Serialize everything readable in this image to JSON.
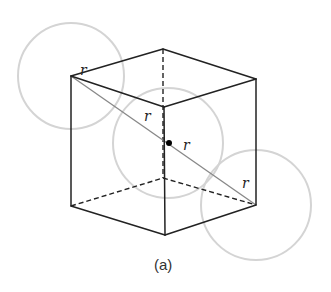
{
  "figure": {
    "caption": "(a)",
    "colors": {
      "edge": "#222222",
      "diagonal": "#888888",
      "circle": "#d4d4d4",
      "dot": "#000000"
    },
    "cube": {
      "vertices": {
        "top_left": [
          71,
          76
        ],
        "top_back": [
          163,
          49
        ],
        "top_right": [
          256,
          79
        ],
        "top_front": [
          164,
          107
        ],
        "bottom_left": [
          71,
          206
        ],
        "bottom_back": [
          163,
          178
        ],
        "bottom_right": [
          256,
          205
        ],
        "bottom_front": [
          165,
          235
        ]
      },
      "visible_edges": [
        [
          "top_left",
          "top_back"
        ],
        [
          "top_back",
          "top_right"
        ],
        [
          "top_right",
          "top_front"
        ],
        [
          "top_front",
          "top_left"
        ],
        [
          "top_left",
          "bottom_left"
        ],
        [
          "top_front",
          "bottom_front"
        ],
        [
          "top_right",
          "bottom_right"
        ],
        [
          "bottom_left",
          "bottom_front"
        ],
        [
          "bottom_front",
          "bottom_right"
        ]
      ],
      "hidden_edges": [
        [
          "top_back",
          "bottom_back"
        ],
        [
          "bottom_left",
          "bottom_back"
        ],
        [
          "bottom_back",
          "bottom_right"
        ]
      ],
      "diagonal": [
        "top_left",
        "bottom_right"
      ],
      "center_dot": [
        169,
        143
      ]
    },
    "circles": [
      {
        "name": "corner-atom-top-left",
        "cx": 71,
        "cy": 76,
        "r": 53
      },
      {
        "name": "center-atom",
        "cx": 168,
        "cy": 143,
        "r": 55
      },
      {
        "name": "corner-atom-bottom-right",
        "cx": 256,
        "cy": 205,
        "r": 55
      }
    ],
    "labels": [
      {
        "text": "r",
        "x": 80,
        "y": 63
      },
      {
        "text": "r",
        "x": 144,
        "y": 109
      },
      {
        "text": "r",
        "x": 183,
        "y": 138
      },
      {
        "text": "r",
        "x": 242,
        "y": 176
      }
    ]
  }
}
